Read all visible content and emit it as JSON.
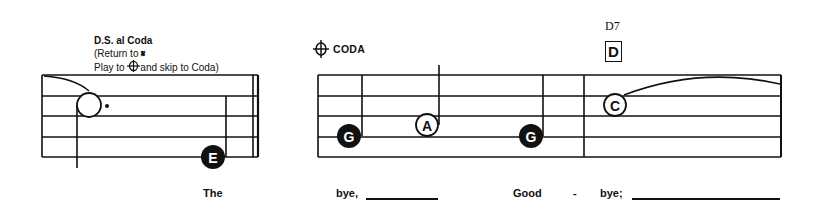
{
  "annotations": {
    "ds_al_coda": {
      "title": "D.S. al Coda",
      "line2_prefix": "(Return to ",
      "segno_icon": "segno-icon",
      "line3_prefix": "Play to ",
      "coda_icon": "coda-icon",
      "line3_suffix": "and skip to Coda)"
    },
    "coda_section": {
      "label": "CODA",
      "icon": "coda-icon"
    },
    "chord": {
      "name": "D7",
      "box_letter": "D"
    }
  },
  "staves": [
    {
      "id": "staff-1",
      "notes": [
        {
          "letter": "",
          "type": "dotted-half-open",
          "note": "whole-open-dotted"
        },
        {
          "letter": "E",
          "type": "quarter-filled"
        }
      ],
      "end_barline": "double"
    },
    {
      "id": "staff-2-coda",
      "notes": [
        {
          "letter": "G",
          "type": "quarter-filled"
        },
        {
          "letter": "A",
          "type": "half-open"
        },
        {
          "letter": "G",
          "type": "quarter-filled"
        },
        {
          "letter": "C",
          "type": "whole-open-tied"
        }
      ]
    }
  ],
  "lyrics": [
    {
      "text": "The"
    },
    {
      "text": "bye,"
    },
    {
      "text": "Good"
    },
    {
      "text": "-"
    },
    {
      "text": "bye;"
    }
  ],
  "colors": {
    "ink": "#111111",
    "paper": "#ffffff"
  }
}
